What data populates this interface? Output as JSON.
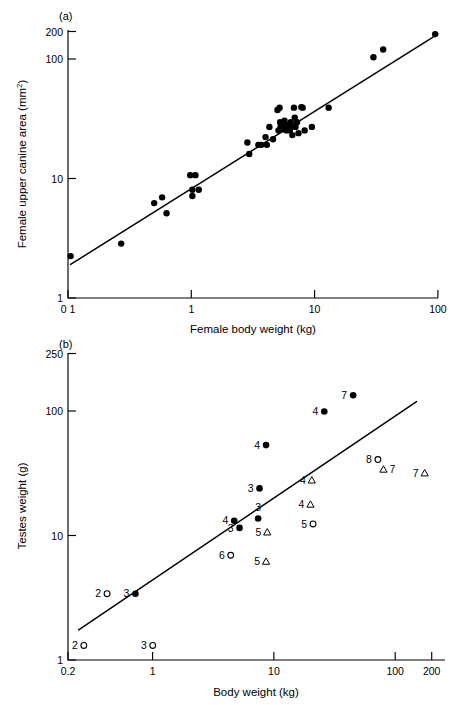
{
  "figure": {
    "panels": [
      {
        "id": "a",
        "label": "(a)",
        "xlabel": "Female body weight (kg)",
        "ylabel": "Female upper canine area (mm²)"
      },
      {
        "id": "b",
        "label": "(b)",
        "xlabel": "Body weight (kg)",
        "ylabel": "Testes weight (g)"
      }
    ],
    "caption_fragment": ""
  },
  "chart_data": [
    {
      "type": "scatter",
      "panel": "a",
      "title": "(a)",
      "xlabel": "Female body weight (kg)",
      "ylabel": "Female upper canine area (mm²)",
      "xscale": "log",
      "yscale": "log",
      "xlim": [
        0.1,
        100
      ],
      "ylim": [
        1,
        200
      ],
      "xticks": [
        0.1,
        1,
        10,
        100
      ],
      "xticklabels": [
        "0 1",
        "1",
        "10",
        "100"
      ],
      "yticks": [
        1,
        10,
        100,
        200
      ],
      "yticklabels": [
        "1",
        "10",
        "100",
        "200"
      ],
      "grid": false,
      "legend": "none",
      "marker": "filled-circle",
      "fit_line": {
        "x": [
          0.105,
          100
        ],
        "y": [
          1.95,
          190
        ]
      },
      "points": [
        {
          "x": 0.105,
          "y": 2.3
        },
        {
          "x": 0.27,
          "y": 2.95
        },
        {
          "x": 0.5,
          "y": 6.6
        },
        {
          "x": 0.58,
          "y": 7.4
        },
        {
          "x": 0.63,
          "y": 5.4
        },
        {
          "x": 0.98,
          "y": 11.5
        },
        {
          "x": 1.02,
          "y": 8.6
        },
        {
          "x": 1.02,
          "y": 7.6
        },
        {
          "x": 1.08,
          "y": 11.5
        },
        {
          "x": 1.15,
          "y": 8.6
        },
        {
          "x": 2.85,
          "y": 22.0
        },
        {
          "x": 2.95,
          "y": 17.5
        },
        {
          "x": 3.5,
          "y": 21.0
        },
        {
          "x": 3.7,
          "y": 21.0
        },
        {
          "x": 4.0,
          "y": 24.5
        },
        {
          "x": 4.1,
          "y": 21.0
        },
        {
          "x": 4.3,
          "y": 30.0
        },
        {
          "x": 4.6,
          "y": 23.5
        },
        {
          "x": 5.0,
          "y": 42.0
        },
        {
          "x": 5.1,
          "y": 28.0
        },
        {
          "x": 5.2,
          "y": 44.0
        },
        {
          "x": 5.25,
          "y": 33.0
        },
        {
          "x": 5.3,
          "y": 30.0
        },
        {
          "x": 5.4,
          "y": 28.5
        },
        {
          "x": 5.5,
          "y": 31.0
        },
        {
          "x": 5.6,
          "y": 29.0
        },
        {
          "x": 5.7,
          "y": 34.0
        },
        {
          "x": 5.8,
          "y": 30.0
        },
        {
          "x": 5.9,
          "y": 28.0
        },
        {
          "x": 6.0,
          "y": 31.0
        },
        {
          "x": 6.1,
          "y": 29.5
        },
        {
          "x": 6.3,
          "y": 28.0
        },
        {
          "x": 6.4,
          "y": 33.0
        },
        {
          "x": 6.5,
          "y": 30.0
        },
        {
          "x": 6.6,
          "y": 25.5
        },
        {
          "x": 6.8,
          "y": 44.0
        },
        {
          "x": 6.9,
          "y": 36.0
        },
        {
          "x": 7.0,
          "y": 30.0
        },
        {
          "x": 7.2,
          "y": 33.0
        },
        {
          "x": 7.4,
          "y": 26.5
        },
        {
          "x": 7.8,
          "y": 44.5
        },
        {
          "x": 8.0,
          "y": 44.0
        },
        {
          "x": 8.3,
          "y": 28.0
        },
        {
          "x": 9.5,
          "y": 30.0
        },
        {
          "x": 13.0,
          "y": 44.0
        },
        {
          "x": 30.0,
          "y": 120.0
        },
        {
          "x": 36.0,
          "y": 140.0
        },
        {
          "x": 95.0,
          "y": 190.0
        }
      ]
    },
    {
      "type": "scatter",
      "panel": "b",
      "title": "(b)",
      "xlabel": "Body weight (kg)",
      "ylabel": "Testes weight (g)",
      "xscale": "log",
      "yscale": "log",
      "xlim": [
        0.2,
        200
      ],
      "ylim": [
        1,
        250
      ],
      "xticks": [
        0.2,
        1,
        10,
        100,
        200
      ],
      "xticklabels": [
        "0.2",
        "1",
        "10",
        "100",
        "200"
      ],
      "yticks": [
        1,
        10,
        100,
        250
      ],
      "yticklabels": [
        "1",
        "10",
        "100",
        "250"
      ],
      "grid": false,
      "legend": "none",
      "fit_line": {
        "x": [
          0.245,
          150
        ],
        "y": [
          1.72,
          105
        ]
      },
      "series": [
        {
          "name": "multi-male (filled circle)",
          "marker": "filled-circle",
          "points": [
            {
              "x": 0.72,
              "y": 3.3,
              "label": "3",
              "label_pos": "left"
            },
            {
              "x": 4.7,
              "y": 12.3,
              "label": "4",
              "label_pos": "left"
            },
            {
              "x": 5.2,
              "y": 10.8,
              "label": "3",
              "label_pos": "left"
            },
            {
              "x": 7.4,
              "y": 12.8,
              "label": "3",
              "label_pos": "above"
            },
            {
              "x": 7.6,
              "y": 22.0,
              "label": "3",
              "label_pos": "left"
            },
            {
              "x": 8.6,
              "y": 48.0,
              "label": "4",
              "label_pos": "left"
            },
            {
              "x": 26.0,
              "y": 88.0,
              "label": "4",
              "label_pos": "left"
            },
            {
              "x": 45.0,
              "y": 118.0,
              "label": "7",
              "label_pos": "left"
            }
          ]
        },
        {
          "name": "unimale (open circle)",
          "marker": "open-circle",
          "points": [
            {
              "x": 0.27,
              "y": 1.3,
              "label": "2",
              "label_pos": "left"
            },
            {
              "x": 0.42,
              "y": 3.3,
              "label": "2",
              "label_pos": "left"
            },
            {
              "x": 1.0,
              "y": 1.3,
              "label": "3",
              "label_pos": "left"
            },
            {
              "x": 4.4,
              "y": 6.6,
              "label": "6",
              "label_pos": "left"
            },
            {
              "x": 21.0,
              "y": 11.6,
              "label": "5",
              "label_pos": "left"
            },
            {
              "x": 72.0,
              "y": 37.0,
              "label": "8",
              "label_pos": "left"
            }
          ]
        },
        {
          "name": "monogamous (open triangle)",
          "marker": "open-triangle",
          "points": [
            {
              "x": 8.6,
              "y": 5.9,
              "label": "5",
              "label_pos": "left"
            },
            {
              "x": 8.8,
              "y": 10.0,
              "label": "5",
              "label_pos": "left"
            },
            {
              "x": 20.0,
              "y": 16.5,
              "label": "4",
              "label_pos": "left"
            },
            {
              "x": 20.5,
              "y": 25.5,
              "label": "4",
              "label_pos": "left"
            },
            {
              "x": 80.0,
              "y": 31.0,
              "label": "7",
              "label_pos": "right"
            },
            {
              "x": 175.0,
              "y": 29.0,
              "label": "7",
              "label_pos": "left"
            }
          ]
        }
      ]
    }
  ]
}
